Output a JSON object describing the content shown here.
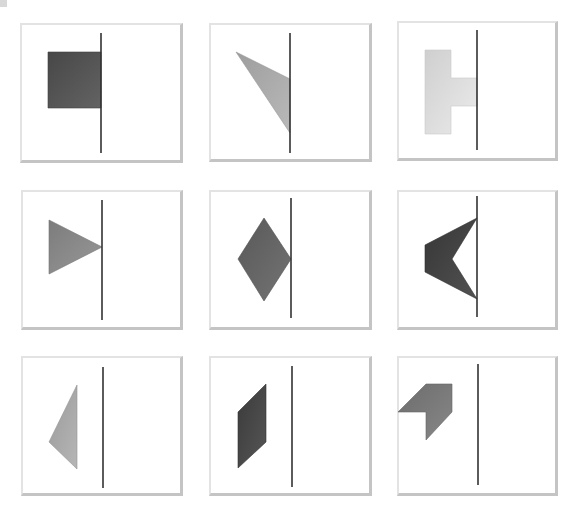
{
  "figure": {
    "background": "#ffffff",
    "panel_border_light": "#e3e3e3",
    "panel_border_shadow": "#c4c4c4",
    "axis_color": "#333333"
  },
  "panels": [
    {
      "id": 1,
      "shape": "square",
      "fill": "#555555",
      "box": [
        20,
        23,
        163,
        140
      ],
      "axis": [
        101,
        33,
        153
      ],
      "points": "48,52 101,52 101,108 48,108"
    },
    {
      "id": 2,
      "shape": "triangle",
      "fill": "#ababab",
      "box": [
        209,
        23,
        163,
        139
      ],
      "axis": [
        290,
        33,
        153
      ],
      "points": "236,52 290,79 290,133"
    },
    {
      "id": 3,
      "shape": "t-shape",
      "fill": "#dddddd",
      "box": [
        397,
        21,
        161,
        140
      ],
      "axis": [
        477,
        30,
        150
      ],
      "points": "425,50 451,50 451,78 477,78 477,106 451,106 451,134 425,134"
    },
    {
      "id": 4,
      "shape": "triangle",
      "fill": "#8a8a8a",
      "box": [
        21,
        190,
        162,
        140
      ],
      "axis": [
        102,
        200,
        320
      ],
      "points": "49,220 102,247 49,274"
    },
    {
      "id": 5,
      "shape": "diamond",
      "fill": "#666666",
      "box": [
        209,
        190,
        163,
        140
      ],
      "axis": [
        291,
        198,
        318
      ],
      "points": "264,218 291,259 264,301 238,259"
    },
    {
      "id": 6,
      "shape": "chevron",
      "fill": "#444444",
      "box": [
        397,
        190,
        161,
        140
      ],
      "axis": [
        477,
        196,
        317
      ],
      "points": "477,218 452,259 477,299 425,272 425,245"
    },
    {
      "id": 7,
      "shape": "triangle",
      "fill": "#a8a8a8",
      "box": [
        21,
        356,
        162,
        140
      ],
      "axis": [
        103,
        367,
        488
      ],
      "points": "77,385 77,469 49,442"
    },
    {
      "id": 8,
      "shape": "parallelogram",
      "fill": "#484848",
      "box": [
        209,
        356,
        163,
        140
      ],
      "axis": [
        292,
        366,
        487
      ],
      "points": "266,384 266,442 238,468 238,412"
    },
    {
      "id": 9,
      "shape": "arrow-corner",
      "fill": "#7a7a7a",
      "box": [
        397,
        356,
        161,
        140
      ],
      "axis": [
        478,
        364,
        485
      ],
      "points": "426,384 452,384 452,412 426,440 426,412 398,412"
    }
  ]
}
